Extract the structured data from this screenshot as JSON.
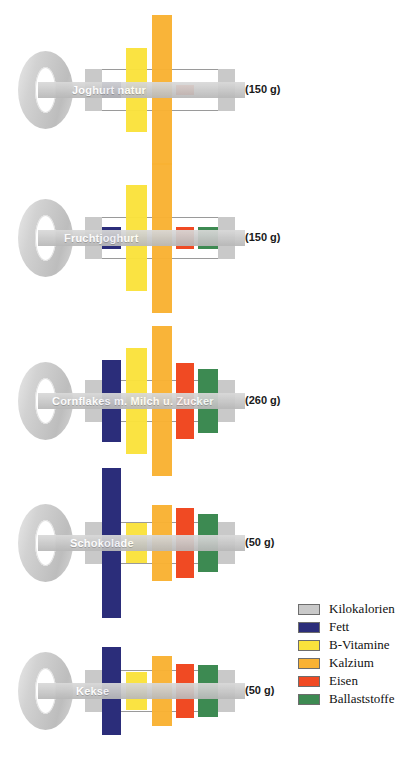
{
  "chart_data": {
    "type": "bar",
    "title": "",
    "subtitle": "",
    "xlabel": "",
    "ylabel": "",
    "grid": false,
    "legend_position": "bottom-right",
    "note": "Each row is drawn as a key; vertical bars are centred on the key shaft and extend symmetrically above and below. Bar length encodes the nutrient contribution. The grey key-bit blocks encode Kilokalorien.",
    "series_names": [
      "Kilokalorien",
      "Fett",
      "B-Vitamine",
      "Kalzium",
      "Eisen",
      "Ballaststoffe"
    ],
    "colors": {
      "kilokalorien": "#c9c9c9",
      "fett": "#2b2d7a",
      "b_vitamine": "#fae23c",
      "kalzium": "#f9b233",
      "eisen": "#f04a23",
      "ballaststoffe": "#3d8a52"
    },
    "categories": [
      "Joghurt natur",
      "Fruchtjoghurt",
      "Cornflakes m. Milch u. Zucker",
      "Schokolade",
      "Kekse"
    ],
    "rows": [
      {
        "label": "Joghurt natur",
        "weight": "(150 g)",
        "values": {
          "kilokalorien": 41,
          "fett": 10,
          "b_vitamine": 56,
          "kalzium": 100,
          "eisen": 6,
          "ballaststoffe": 0
        }
      },
      {
        "label": "Fruchtjoghurt",
        "weight": "(150 g)",
        "values": {
          "kilokalorien": 41,
          "fett": 14,
          "b_vitamine": 71,
          "kalzium": 100,
          "eisen": 14,
          "ballaststoffe": 14
        }
      },
      {
        "label": "Cornflakes m. Milch u. Zucker",
        "weight": "(260 g)",
        "values": {
          "kilokalorien": 41,
          "fett": 54,
          "b_vitamine": 70,
          "kalzium": 100,
          "eisen": 50,
          "ballaststoffe": 42
        }
      },
      {
        "label": "Schokolade",
        "weight": "(50 g)",
        "values": {
          "kilokalorien": 41,
          "fett": 100,
          "b_vitamine": 27,
          "kalzium": 50,
          "eisen": 46,
          "ballaststoffe": 38
        }
      },
      {
        "label": "Kekse",
        "weight": "(50 g)",
        "values": {
          "kilokalorien": 41,
          "fett": 58,
          "b_vitamine": 25,
          "kalzium": 46,
          "eisen": 36,
          "ballaststoffe": 34
        }
      }
    ]
  },
  "rows": [
    {
      "label": "Joghurt natur",
      "weight": "(150 g)"
    },
    {
      "label": "Fruchtjoghurt",
      "weight": "(150 g)"
    },
    {
      "label": "Cornflakes m. Milch u. Zucker",
      "weight": "(260 g)"
    },
    {
      "label": "Schokolade",
      "weight": "(50 g)"
    },
    {
      "label": "Kekse",
      "weight": "(50 g)"
    }
  ],
  "legend": {
    "items": [
      {
        "label": "Kilokalorien",
        "color": "#c9c9c9"
      },
      {
        "label": "Fett",
        "color": "#2b2d7a"
      },
      {
        "label": "B-Vitamine",
        "color": "#fae23c"
      },
      {
        "label": "Kalzium",
        "color": "#f9b233"
      },
      {
        "label": "Eisen",
        "color": "#f04a23"
      },
      {
        "label": "Ballaststoffe",
        "color": "#3d8a52"
      }
    ]
  }
}
